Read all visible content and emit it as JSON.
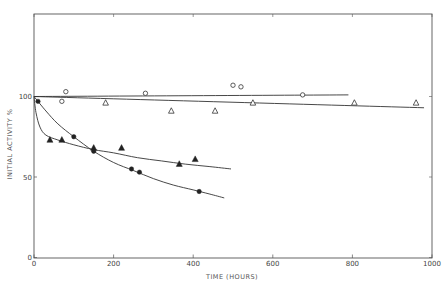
{
  "chart_data": {
    "type": "scatter",
    "title": "",
    "xlabel": "TIME (HOURS)",
    "ylabel": "INITIAL ACTIVITY %",
    "xlim": [
      0,
      1000
    ],
    "ylim": [
      0,
      150
    ],
    "x_ticks": [
      0,
      200,
      400,
      600,
      800,
      1000
    ],
    "x_tick_labels": [
      "0",
      "200",
      "400",
      "600",
      "800",
      "1000"
    ],
    "y_ticks": [
      0,
      50,
      100
    ],
    "y_tick_labels": [
      "0",
      "50",
      "100"
    ],
    "grid": false,
    "legend": null,
    "series": [
      {
        "name": "open-circles",
        "marker": "open-circle",
        "points": [
          [
            70,
            97
          ],
          [
            80,
            103
          ],
          [
            280,
            102
          ],
          [
            500,
            107
          ],
          [
            520,
            106
          ],
          [
            675,
            101
          ]
        ],
        "fit_line": [
          [
            0,
            100
          ],
          [
            790,
            101
          ]
        ]
      },
      {
        "name": "open-triangles",
        "marker": "open-triangle",
        "points": [
          [
            180,
            96
          ],
          [
            345,
            91
          ],
          [
            455,
            91
          ],
          [
            550,
            96
          ],
          [
            805,
            96
          ],
          [
            960,
            96
          ]
        ],
        "fit_line": [
          [
            0,
            100
          ],
          [
            980,
            93
          ]
        ]
      },
      {
        "name": "filled-triangles",
        "marker": "filled-triangle",
        "points": [
          [
            40,
            73
          ],
          [
            70,
            73
          ],
          [
            150,
            68
          ],
          [
            220,
            68
          ],
          [
            365,
            58
          ],
          [
            405,
            61
          ]
        ],
        "fit_curve": [
          [
            0,
            100
          ],
          [
            5,
            90
          ],
          [
            15,
            81
          ],
          [
            30,
            76
          ],
          [
            60,
            73
          ],
          [
            100,
            70
          ],
          [
            150,
            67
          ],
          [
            200,
            65
          ],
          [
            260,
            62
          ],
          [
            320,
            60
          ],
          [
            380,
            58
          ],
          [
            440,
            56.5
          ],
          [
            495,
            55
          ]
        ]
      },
      {
        "name": "filled-circles",
        "marker": "filled-circle",
        "points": [
          [
            10,
            97
          ],
          [
            100,
            75
          ],
          [
            150,
            66
          ],
          [
            245,
            55
          ],
          [
            265,
            53
          ],
          [
            415,
            41
          ]
        ],
        "fit_curve": [
          [
            0,
            100
          ],
          [
            30,
            91
          ],
          [
            60,
            83
          ],
          [
            100,
            75
          ],
          [
            150,
            66
          ],
          [
            200,
            59
          ],
          [
            250,
            54
          ],
          [
            300,
            49
          ],
          [
            350,
            45
          ],
          [
            400,
            42
          ],
          [
            440,
            39.5
          ],
          [
            478,
            37
          ]
        ]
      }
    ]
  }
}
